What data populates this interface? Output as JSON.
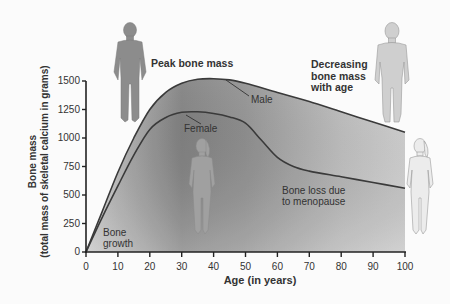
{
  "chart_data": {
    "type": "area",
    "title": "",
    "xlabel": "Age (in years)",
    "ylabel": "Bone mass",
    "ylabel_sub": "(total mass of skeletal calcium in grams)",
    "xlim": [
      0,
      100
    ],
    "ylim": [
      0,
      1500
    ],
    "x_ticks": [
      "0",
      "10",
      "20",
      "30",
      "40",
      "50",
      "60",
      "70",
      "80",
      "90",
      "100"
    ],
    "y_ticks": [
      "0",
      "250",
      "500",
      "750",
      "1000",
      "1250",
      "1500"
    ],
    "grid": false,
    "series": [
      {
        "name": "Male",
        "x": [
          0,
          5,
          10,
          15,
          20,
          25,
          30,
          35,
          40,
          45,
          50,
          60,
          70,
          80,
          90,
          100
        ],
        "values": [
          0,
          350,
          700,
          1000,
          1250,
          1400,
          1480,
          1515,
          1520,
          1510,
          1480,
          1400,
          1320,
          1230,
          1140,
          1050
        ]
      },
      {
        "name": "Female",
        "x": [
          0,
          5,
          10,
          15,
          20,
          25,
          30,
          35,
          40,
          45,
          50,
          55,
          60,
          65,
          70,
          80,
          90,
          100
        ],
        "values": [
          0,
          300,
          580,
          850,
          1075,
          1180,
          1225,
          1230,
          1215,
          1185,
          1130,
          980,
          830,
          750,
          710,
          660,
          610,
          560
        ]
      }
    ],
    "annotations": [
      {
        "text": "Peak bone mass",
        "age": 35
      },
      {
        "text": "Decreasing bone mass with age",
        "age": 85
      },
      {
        "text": "Bone loss due to menopause",
        "age": 70
      },
      {
        "text": "Bone growth",
        "age": 5
      },
      {
        "text": "Male",
        "age": 47
      },
      {
        "text": "Female",
        "age": 33
      }
    ]
  },
  "labels": {
    "peak": "Peak bone mass",
    "decreasing_1": "Decreasing",
    "decreasing_2": "bone mass",
    "decreasing_3": "with age",
    "menopause_1": "Bone loss due",
    "menopause_2": "to menopause",
    "growth_1": "Bone",
    "growth_2": "growth",
    "male": "Male",
    "female": "Female",
    "xlabel": "Age (in years)",
    "ylabel": "Bone mass",
    "ylabel_sub": "(total mass of skeletal calcium in grams)"
  },
  "figures": [
    "child-figure",
    "adult-male-figure",
    "adult-female-figure",
    "elderly-female-figure"
  ]
}
